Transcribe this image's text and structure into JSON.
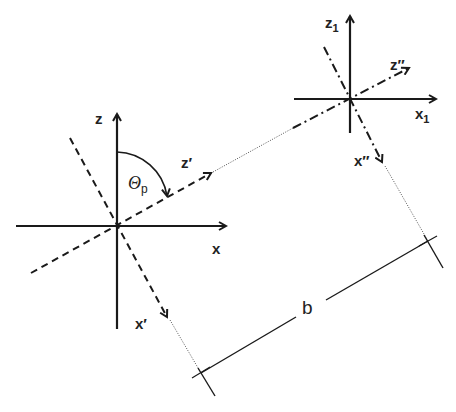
{
  "diagram": {
    "type": "coordinate-frame-transformation",
    "line_color": "#1a1a1a",
    "frame_original": {
      "origin": [
        117,
        226
      ],
      "axis_x_label": "x",
      "axis_z_label": "z"
    },
    "frame_rotated": {
      "axis_x_label": "x′",
      "axis_z_label": "z′",
      "style": "dashed"
    },
    "angle": {
      "symbol": "Θ",
      "subscript": "p"
    },
    "frame_shifted": {
      "origin": [
        350,
        99
      ],
      "axis_x_label": "x",
      "axis_x_sub": "1",
      "axis_z_label": "z",
      "axis_z_sub": "1"
    },
    "frame_rotated_shifted": {
      "axis_x_label": "x″",
      "axis_z_label": "z″",
      "style": "dash-dot"
    },
    "dimension": {
      "label": "b",
      "start": [
        201,
        373
      ],
      "end": [
        428,
        241
      ]
    }
  }
}
